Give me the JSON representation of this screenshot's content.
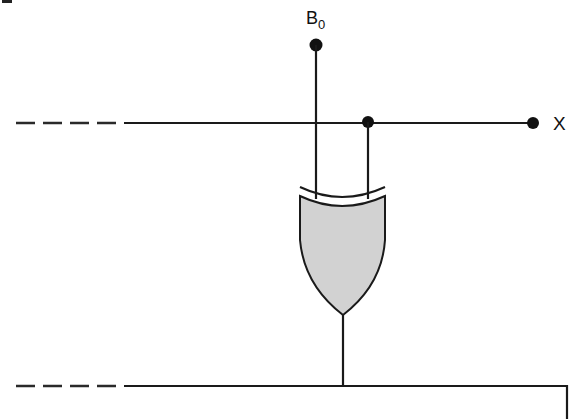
{
  "diagram": {
    "type": "logic-circuit",
    "gate": {
      "kind": "XOR",
      "fill_color": "#d2d2d2"
    },
    "labels": {
      "input_b": "B",
      "input_b_subscript": "0",
      "output_x": "X"
    },
    "wires": {
      "top_bus": {
        "style": "dashed-then-solid",
        "connects_to": "X"
      },
      "bottom_bus": {
        "style": "dashed-then-solid",
        "connects_to": "gate-output"
      }
    },
    "colors": {
      "line": "#1a1a1a",
      "gate_fill": "#d2d2d2",
      "background": "#ffffff"
    }
  }
}
